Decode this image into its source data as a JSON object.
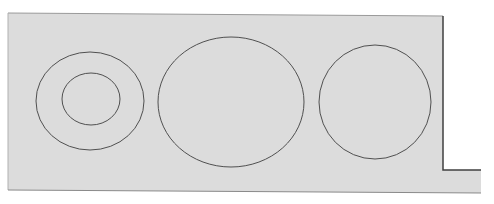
{
  "diagram": {
    "background_color": "#ffffff",
    "panel_color": "#dcdcdc",
    "line_color": "#505050",
    "panel": {
      "outline": "M8,13 L443,16 L443,170 L481,170 L481,193 L8,190 Z",
      "right_edge": "M443,16 L443,170 L481,170"
    },
    "shapes": [
      {
        "name": "outer-ring-left",
        "cx": 90,
        "cy": 101,
        "rx": 54,
        "ry": 49
      },
      {
        "name": "inner-ring-left",
        "cx": 91,
        "cy": 99,
        "rx": 29,
        "ry": 26
      },
      {
        "name": "large-ellipse-center",
        "cx": 231,
        "cy": 102,
        "rx": 73,
        "ry": 65
      },
      {
        "name": "circle-right",
        "cx": 375,
        "cy": 102,
        "rx": 56,
        "ry": 57
      }
    ]
  }
}
